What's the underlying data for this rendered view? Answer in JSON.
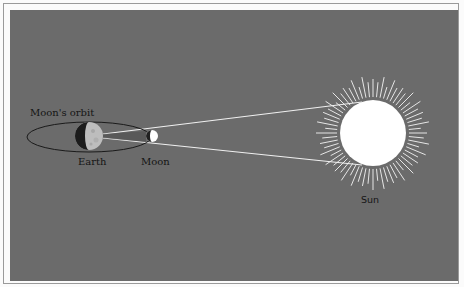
{
  "diagram": {
    "labels": {
      "orbit": "Moon's orbit",
      "earth": "Earth",
      "moon": "Moon",
      "sun": "Sun"
    },
    "colors": {
      "background": "#6b6b6b",
      "frame": "#9a9a9a",
      "rays": "#e6e6e6",
      "sun_disc": "#ffffff",
      "sight_lines": "#f0f0f0",
      "orbit": "#1a1a1a",
      "earth_dark": "#1c1c1c",
      "earth_light": "#bdbdbd",
      "moon_dark": "#202020",
      "moon_light": "#ffffff"
    },
    "geometry": {
      "earth": {
        "cx": 89,
        "cy": 136,
        "r": 14
      },
      "moon": {
        "cx": 152,
        "cy": 136,
        "r": 6
      },
      "orbit": {
        "cx": 89,
        "cy": 137,
        "rx": 62,
        "ry": 15
      },
      "sun": {
        "cx": 373,
        "cy": 133,
        "r": 33,
        "ray_inner": 36,
        "ray_outer": 57,
        "ray_count": 64
      }
    }
  }
}
